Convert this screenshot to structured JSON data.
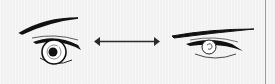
{
  "illustration": {
    "subject": "eye-shape-comparison",
    "left": "round-eye-icon",
    "middle": "double-arrow-icon",
    "right": "narrow-eye-icon",
    "stroke_color": "#111111",
    "arrow_color": "#2a2a2a",
    "background": "#f6f6f6"
  }
}
